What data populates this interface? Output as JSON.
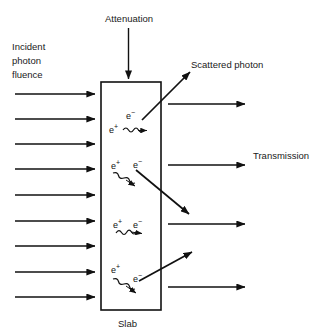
{
  "figure": {
    "background_color": "#ffffff",
    "line_color": "#111111",
    "text_color": "#1a1a1a"
  },
  "labels": {
    "attenuation": "Attenuation",
    "incident_line1": "Incident",
    "incident_line2": "photon",
    "incident_line3": "fluence",
    "scattered_photon": "Scattered photon",
    "transmission": "Transmission",
    "slab": "Slab"
  },
  "particles": {
    "electron_base": "e",
    "electron_sup": "−",
    "positron_base": "e",
    "positron_sup": "+",
    "pairs": [
      {
        "id": "pair-1",
        "positron": "e+",
        "electron": "e−"
      },
      {
        "id": "pair-2",
        "positron": "e+",
        "electron": "e−"
      },
      {
        "id": "pair-3",
        "positron": "e+",
        "electron": "e−"
      },
      {
        "id": "pair-4",
        "positron": "e+",
        "electron": "e−"
      }
    ]
  },
  "counts": {
    "incident_arrows": 9,
    "transmitted_arrows": 4,
    "scattered_arrows": 3,
    "annihilation_squiggles": 4,
    "electron_positron_pairs": 4
  }
}
